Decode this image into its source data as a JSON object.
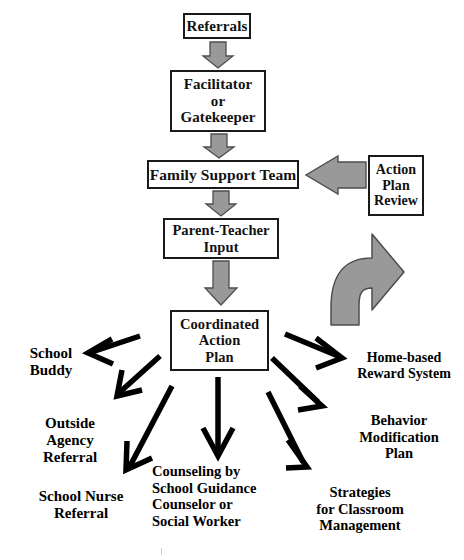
{
  "diagram": {
    "colors": {
      "arrow_gray_fill": "#999999",
      "arrow_gray_stroke": "#4d4d4d",
      "arrow_black": "#000000",
      "box_border": "#1a1a1a",
      "background": "#ffffff"
    },
    "nodes": [
      {
        "id": "referrals",
        "label": "Referrals",
        "lines": [
          "Referrals"
        ]
      },
      {
        "id": "facilitator",
        "label": "Facilitator or Gatekeeper",
        "lines": [
          "Facilitator",
          "or",
          "Gatekeeper"
        ]
      },
      {
        "id": "family_support",
        "label": "Family Support Team",
        "lines": [
          "Family Support Team"
        ]
      },
      {
        "id": "parent_teacher",
        "label": "Parent-Teacher Input",
        "lines": [
          "Parent-Teacher",
          "Input"
        ]
      },
      {
        "id": "coordinated",
        "label": "Coordinated Action Plan",
        "lines": [
          "Coordinated",
          "Action",
          "Plan"
        ]
      },
      {
        "id": "action_review",
        "label": "Action Plan Review",
        "lines": [
          "Action",
          "Plan",
          "Review"
        ]
      }
    ],
    "outcomes": [
      {
        "id": "school_buddy",
        "label": "School Buddy",
        "lines": [
          "School",
          "Buddy"
        ]
      },
      {
        "id": "outside_agency",
        "label": "Outside Agency Referral",
        "lines": [
          "Outside",
          "Agency",
          "Referral"
        ]
      },
      {
        "id": "school_nurse",
        "label": "School Nurse Referral",
        "lines": [
          "School Nurse",
          "Referral"
        ]
      },
      {
        "id": "counseling",
        "label": "Counseling by School Guidance Counselor or Social Worker",
        "lines": [
          "Counseling by",
          "School Guidance",
          "Counselor or",
          "Social Worker"
        ]
      },
      {
        "id": "home_based",
        "label": "Home-based Reward System",
        "lines": [
          "Home-based",
          "Reward System"
        ]
      },
      {
        "id": "behavior_mod",
        "label": "Behavior Modification Plan",
        "lines": [
          "Behavior",
          "Modification",
          "Plan"
        ]
      },
      {
        "id": "strategies",
        "label": "Strategies for Classroom Management",
        "lines": [
          "Strategies",
          "for Classroom",
          "Management"
        ]
      }
    ],
    "connectors": [
      {
        "id": "referrals-to-facilitator",
        "style": "gray-block-arrow",
        "direction": "down"
      },
      {
        "id": "facilitator-to-family-support",
        "style": "gray-block-arrow",
        "direction": "down"
      },
      {
        "id": "family-support-to-parent-teacher",
        "style": "gray-block-arrow",
        "direction": "down"
      },
      {
        "id": "parent-teacher-to-coordinated",
        "style": "gray-block-arrow",
        "direction": "down"
      },
      {
        "id": "action-review-to-family-support",
        "style": "gray-block-arrow",
        "direction": "left"
      },
      {
        "id": "coordinated-to-action-review",
        "style": "gray-curved-arrow",
        "direction": "up-curve"
      },
      {
        "id": "coordinated-to-school-buddy",
        "style": "black-line-arrow",
        "direction": "up-left"
      },
      {
        "id": "coordinated-to-outside-agency",
        "style": "black-line-arrow",
        "direction": "down-left"
      },
      {
        "id": "coordinated-to-school-nurse",
        "style": "black-line-arrow",
        "direction": "down-left"
      },
      {
        "id": "coordinated-to-counseling",
        "style": "black-line-arrow",
        "direction": "down"
      },
      {
        "id": "coordinated-to-home-based",
        "style": "black-line-arrow",
        "direction": "down-right"
      },
      {
        "id": "coordinated-to-behavior-mod",
        "style": "black-line-arrow",
        "direction": "down-right"
      },
      {
        "id": "coordinated-to-strategies",
        "style": "black-line-arrow",
        "direction": "down-right"
      }
    ]
  }
}
